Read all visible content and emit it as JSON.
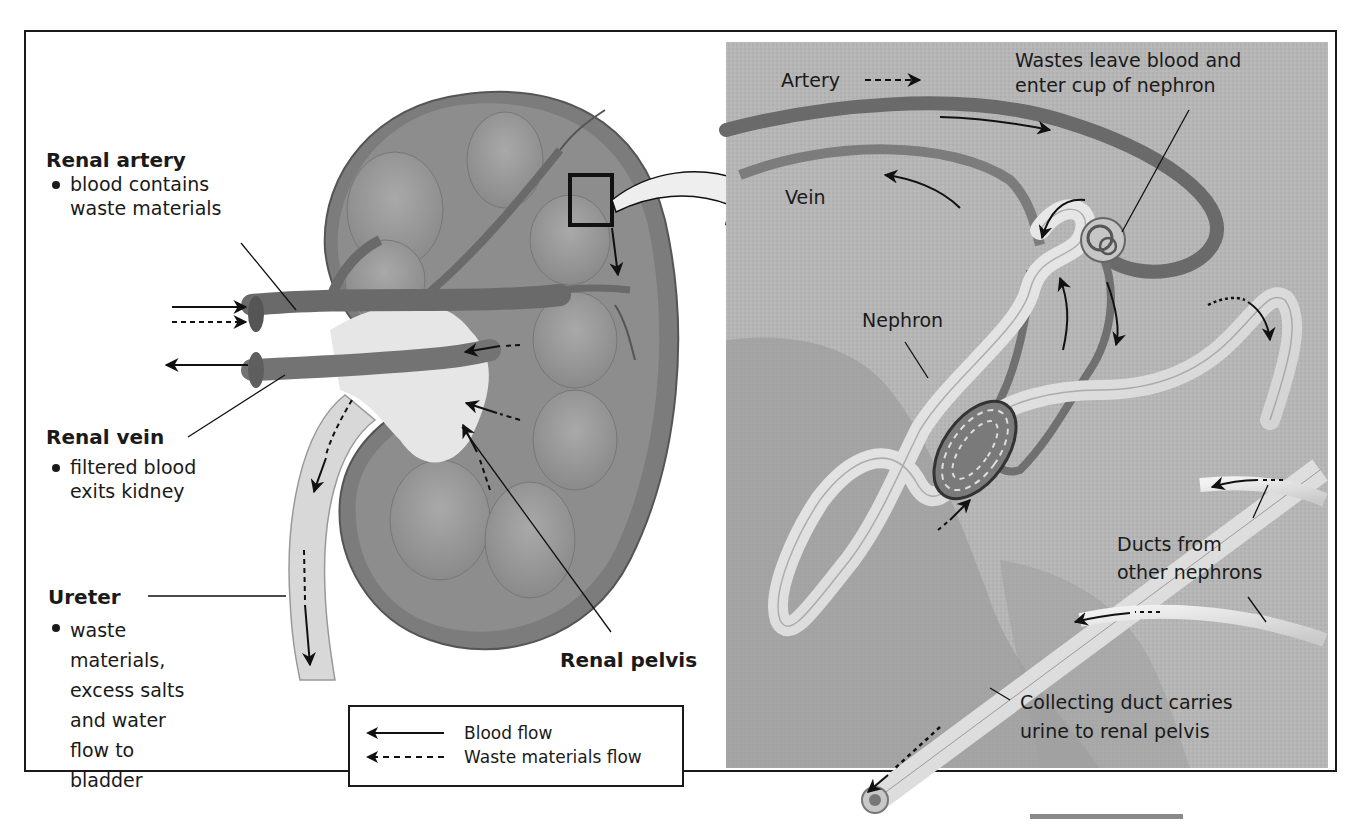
{
  "figure": {
    "left_panel": {
      "renal_artery": {
        "heading": "Renal artery",
        "bullets": [
          "blood contains waste materials"
        ],
        "lines": [
          "blood contains",
          "waste materials"
        ]
      },
      "renal_vein": {
        "heading": "Renal vein",
        "lines": [
          "filtered blood",
          "exits kidney"
        ]
      },
      "ureter": {
        "heading": "Ureter",
        "lines": [
          "waste",
          "materials,",
          "excess salts",
          "and water",
          "flow to",
          "bladder"
        ]
      },
      "renal_pelvis": {
        "heading": "Renal pelvis"
      }
    },
    "right_panel": {
      "artery": "Artery",
      "vein": "Vein",
      "wastes_callout": [
        "Wastes leave blood and",
        "enter cup of nephron"
      ],
      "nephron": "Nephron",
      "ducts_callout": [
        "Ducts from",
        "other nephrons"
      ],
      "collecting_duct_callout": [
        "Collecting duct carries",
        "urine to renal pelvis"
      ]
    },
    "legend": {
      "items": [
        {
          "label": "Blood flow",
          "style": "solid-arrow"
        },
        {
          "label": "Waste materials flow",
          "style": "dashed-arrow"
        }
      ]
    },
    "colors": {
      "frame": "#1a1a1a",
      "kidney_tissue": "#8c8c8c",
      "vessel": "#6e6e6e",
      "inset_background": "#b4b4b4",
      "tubule": "#dcdcdc",
      "scalebar": "#8a8a8a"
    }
  }
}
